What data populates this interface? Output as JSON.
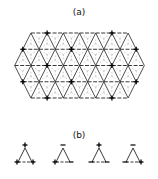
{
  "panel_a": {
    "label": "(a)",
    "description": "Triangular lattice with hexagonal outline; plus signs on selected nodes",
    "rows": 5,
    "plus_marker": "+"
  },
  "panel_b": {
    "label": "(b)",
    "triangles": [
      {
        "top": "+",
        "left": "+",
        "right": "+"
      },
      {
        "top": "-",
        "left": "+",
        "right": "-"
      },
      {
        "top": "+",
        "left": "-",
        "right": "-"
      },
      {
        "top": "-",
        "left": "-",
        "right": "+"
      }
    ]
  },
  "colors": {
    "ink": "#222222",
    "background": "#ffffff"
  }
}
